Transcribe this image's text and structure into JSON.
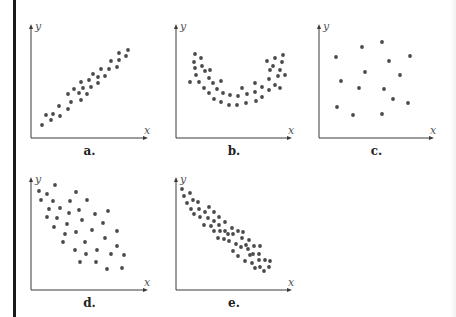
{
  "figure": {
    "panels": [
      {
        "id": "a",
        "label": "a.",
        "x_axis_label": "x",
        "y_axis_label": "y",
        "description": "strong positive linear correlation"
      },
      {
        "id": "b",
        "label": "b.",
        "x_axis_label": "x",
        "y_axis_label": "y",
        "description": "U-shaped (nonlinear) relationship"
      },
      {
        "id": "c",
        "label": "c.",
        "x_axis_label": "x",
        "y_axis_label": "y",
        "description": "no correlation"
      },
      {
        "id": "d",
        "label": "d.",
        "x_axis_label": "x",
        "y_axis_label": "y",
        "description": "moderate negative linear correlation"
      },
      {
        "id": "e",
        "label": "e.",
        "x_axis_label": "x",
        "y_axis_label": "y",
        "description": "strong negative linear correlation"
      }
    ]
  },
  "chart_data": [
    {
      "type": "scatter",
      "title": "a.",
      "xlabel": "x",
      "ylabel": "y",
      "axes": {
        "origin": [
          31,
          138
        ],
        "x_end": 148,
        "y_top": 24
      },
      "points": [
        [
          42,
          125
        ],
        [
          46,
          115
        ],
        [
          51,
          120
        ],
        [
          53,
          114
        ],
        [
          59,
          106
        ],
        [
          60,
          116
        ],
        [
          68,
          94
        ],
        [
          68,
          109
        ],
        [
          71,
          102
        ],
        [
          74,
          89
        ],
        [
          79,
          93
        ],
        [
          81,
          82
        ],
        [
          81,
          100
        ],
        [
          83,
          88
        ],
        [
          87,
          94
        ],
        [
          89,
          80
        ],
        [
          91,
          87
        ],
        [
          93,
          74
        ],
        [
          98,
          77
        ],
        [
          98,
          83
        ],
        [
          101,
          69
        ],
        [
          105,
          76
        ],
        [
          109,
          69
        ],
        [
          111,
          61
        ],
        [
          117,
          67
        ],
        [
          119,
          60
        ],
        [
          119,
          53
        ],
        [
          126,
          56
        ],
        [
          128,
          50
        ]
      ]
    },
    {
      "type": "scatter",
      "title": "b.",
      "xlabel": "x",
      "ylabel": "y",
      "axes": {
        "origin": [
          176,
          138
        ],
        "x_end": 292,
        "y_top": 24
      },
      "points": [
        [
          195,
          54
        ],
        [
          201,
          58
        ],
        [
          194,
          62
        ],
        [
          202,
          66
        ],
        [
          195,
          68
        ],
        [
          205,
          71
        ],
        [
          210,
          70
        ],
        [
          196,
          75
        ],
        [
          209,
          78
        ],
        [
          190,
          82
        ],
        [
          199,
          82
        ],
        [
          213,
          83
        ],
        [
          221,
          81
        ],
        [
          204,
          88
        ],
        [
          217,
          89
        ],
        [
          209,
          93
        ],
        [
          223,
          93
        ],
        [
          230,
          95
        ],
        [
          238,
          96
        ],
        [
          242,
          88
        ],
        [
          247,
          94
        ],
        [
          214,
          99
        ],
        [
          221,
          102
        ],
        [
          229,
          105
        ],
        [
          237,
          105
        ],
        [
          246,
          103
        ],
        [
          255,
          83
        ],
        [
          255,
          92
        ],
        [
          262,
          87
        ],
        [
          262,
          97
        ],
        [
          256,
          101
        ],
        [
          267,
          61
        ],
        [
          275,
          58
        ],
        [
          283,
          55
        ],
        [
          273,
          66
        ],
        [
          282,
          62
        ],
        [
          270,
          70
        ],
        [
          280,
          70
        ],
        [
          269,
          79
        ],
        [
          278,
          76
        ],
        [
          285,
          75
        ],
        [
          269,
          90
        ],
        [
          275,
          85
        ],
        [
          280,
          88
        ]
      ]
    },
    {
      "type": "scatter",
      "title": "c.",
      "xlabel": "x",
      "ylabel": "y",
      "axes": {
        "origin": [
          319,
          138
        ],
        "x_end": 434,
        "y_top": 24
      },
      "points": [
        [
          336,
          57
        ],
        [
          362,
          47
        ],
        [
          382,
          42
        ],
        [
          389,
          61
        ],
        [
          410,
          56
        ],
        [
          365,
          72
        ],
        [
          400,
          75
        ],
        [
          341,
          81
        ],
        [
          359,
          88
        ],
        [
          384,
          89
        ],
        [
          393,
          99
        ],
        [
          408,
          103
        ],
        [
          337,
          107
        ],
        [
          353,
          115
        ],
        [
          382,
          114
        ]
      ]
    },
    {
      "type": "scatter",
      "title": "d.",
      "xlabel": "x",
      "ylabel": "y",
      "axes": {
        "origin": [
          31,
          290
        ],
        "x_end": 148,
        "y_top": 177
      },
      "points": [
        [
          39,
          191
        ],
        [
          55,
          185
        ],
        [
          47,
          194
        ],
        [
          76,
          192
        ],
        [
          41,
          200
        ],
        [
          53,
          201
        ],
        [
          70,
          201
        ],
        [
          87,
          200
        ],
        [
          49,
          209
        ],
        [
          60,
          208
        ],
        [
          79,
          210
        ],
        [
          69,
          213
        ],
        [
          47,
          217
        ],
        [
          57,
          218
        ],
        [
          82,
          220
        ],
        [
          95,
          214
        ],
        [
          108,
          211
        ],
        [
          67,
          224
        ],
        [
          103,
          223
        ],
        [
          54,
          227
        ],
        [
          76,
          232
        ],
        [
          92,
          230
        ],
        [
          117,
          231
        ],
        [
          65,
          234
        ],
        [
          105,
          238
        ],
        [
          63,
          242
        ],
        [
          85,
          242
        ],
        [
          117,
          246
        ],
        [
          75,
          250
        ],
        [
          97,
          250
        ],
        [
          86,
          254
        ],
        [
          111,
          254
        ],
        [
          124,
          255
        ],
        [
          80,
          262
        ],
        [
          96,
          262
        ],
        [
          107,
          269
        ],
        [
          122,
          268
        ]
      ]
    },
    {
      "type": "scatter",
      "title": "e.",
      "xlabel": "x",
      "ylabel": "y",
      "axes": {
        "origin": [
          176,
          290
        ],
        "x_end": 292,
        "y_top": 177
      },
      "points": [
        [
          182,
          189
        ],
        [
          184,
          196
        ],
        [
          190,
          193
        ],
        [
          187,
          203
        ],
        [
          193,
          200
        ],
        [
          198,
          202
        ],
        [
          191,
          209
        ],
        [
          199,
          209
        ],
        [
          194,
          214
        ],
        [
          200,
          217
        ],
        [
          205,
          212
        ],
        [
          209,
          207
        ],
        [
          214,
          212
        ],
        [
          204,
          225
        ],
        [
          208,
          218
        ],
        [
          214,
          221
        ],
        [
          219,
          217
        ],
        [
          211,
          226
        ],
        [
          214,
          231
        ],
        [
          219,
          225
        ],
        [
          225,
          222
        ],
        [
          220,
          231
        ],
        [
          225,
          231
        ],
        [
          218,
          238
        ],
        [
          224,
          239
        ],
        [
          228,
          234
        ],
        [
          232,
          228
        ],
        [
          233,
          234
        ],
        [
          229,
          241
        ],
        [
          238,
          231
        ],
        [
          243,
          232
        ],
        [
          236,
          244
        ],
        [
          242,
          238
        ],
        [
          233,
          251
        ],
        [
          241,
          247
        ],
        [
          249,
          240
        ],
        [
          246,
          245
        ],
        [
          238,
          256
        ],
        [
          248,
          249
        ],
        [
          254,
          246
        ],
        [
          250,
          255
        ],
        [
          245,
          261
        ],
        [
          253,
          254
        ],
        [
          260,
          246
        ],
        [
          259,
          254
        ],
        [
          252,
          263
        ],
        [
          259,
          260
        ],
        [
          265,
          260
        ],
        [
          255,
          268
        ],
        [
          260,
          267
        ],
        [
          264,
          271
        ],
        [
          269,
          267
        ],
        [
          270,
          261
        ]
      ]
    }
  ]
}
